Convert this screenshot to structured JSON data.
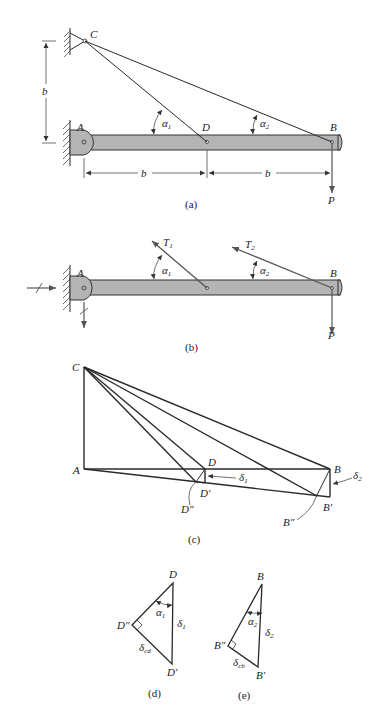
{
  "figure": {
    "panels": [
      {
        "id": "a",
        "caption": "(a)"
      },
      {
        "id": "b",
        "caption": "(b)"
      },
      {
        "id": "c",
        "caption": "(c)"
      },
      {
        "id": "d",
        "caption": "(d)"
      },
      {
        "id": "e",
        "caption": "(e)"
      }
    ]
  },
  "panel_a": {
    "caption": "(a)",
    "labels": {
      "C": "C",
      "A": "A",
      "D": "D",
      "B": "B",
      "P": "P",
      "b_vert": "b",
      "b_left": "b",
      "b_right": "b"
    },
    "angles": {
      "alpha1": "α",
      "alpha1_sub": "1",
      "alpha2": "α",
      "alpha2_sub": "2"
    }
  },
  "panel_b": {
    "caption": "(b)",
    "labels": {
      "A": "A",
      "B": "B",
      "P": "P",
      "T1": "T",
      "T1_sub": "1",
      "T2": "T",
      "T2_sub": "2"
    },
    "angles": {
      "alpha1": "α",
      "alpha1_sub": "1",
      "alpha2": "α",
      "alpha2_sub": "2"
    }
  },
  "panel_c": {
    "caption": "(c)",
    "labels": {
      "C": "C",
      "A": "A",
      "D": "D",
      "B": "B",
      "Dp": "D′",
      "Dpp": "D″",
      "Bp": "B′",
      "Bpp": "B″",
      "delta1": "δ",
      "delta1_sub": "1",
      "delta2": "δ",
      "delta2_sub": "2"
    }
  },
  "panel_d": {
    "caption": "(d)",
    "labels": {
      "D": "D",
      "Dpp": "D″",
      "Dp": "D′",
      "alpha": "α",
      "alpha_sub": "1",
      "delta": "δ",
      "delta_sub": "1",
      "delta_cd": "δ",
      "delta_cd_sub": "cd"
    }
  },
  "panel_e": {
    "caption": "(e)",
    "labels": {
      "B": "B",
      "Bpp": "B″",
      "Bp": "B′",
      "alpha": "α",
      "alpha_sub": "2",
      "delta": "δ",
      "delta_sub": "2",
      "delta_cb": "δ",
      "delta_cb_sub": "cb"
    }
  }
}
